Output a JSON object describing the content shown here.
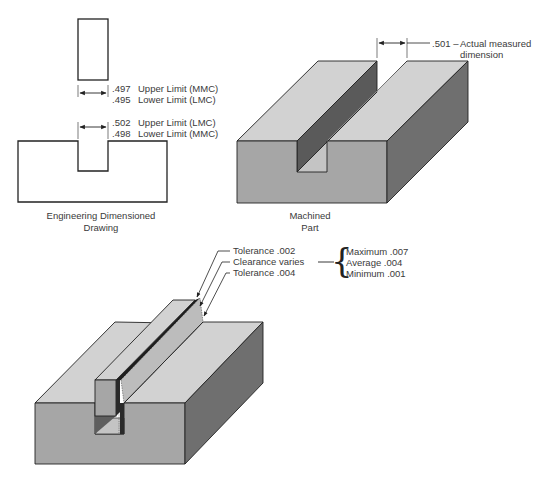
{
  "colors": {
    "top_face": "#d2d2d2",
    "front_face": "#a6a6a6",
    "side_face": "#6f6f6f",
    "slot_wall": "#5a5a5a",
    "slot_floor": "#c4c4c4",
    "clearance_dark": "#1e1e1e",
    "line": "#222222",
    "text": "#3a3a3a"
  },
  "drawing": {
    "shaft_dims": {
      "upper_value": ".497",
      "upper_label": "Upper Limit (MMC)",
      "lower_value": ".495",
      "lower_label": "Lower Limit (LMC)"
    },
    "slot_dims": {
      "upper_value": ".502",
      "upper_label": "Upper Limit (LMC)",
      "lower_value": ".498",
      "lower_label": "Lower Limit (MMC)"
    },
    "caption_line1": "Engineering Dimensioned",
    "caption_line2": "Drawing"
  },
  "machined_part": {
    "measured_value": ".501 –",
    "measured_label_line1": "Actual measured",
    "measured_label_line2": "dimension",
    "caption_line1": "Machined",
    "caption_line2": "Part"
  },
  "assembly": {
    "callouts": [
      {
        "label": "Tolerance .002"
      },
      {
        "label": "Clearance varies"
      },
      {
        "label": "Tolerance .004"
      }
    ],
    "clearance_range": {
      "maximum": "Maximum .007",
      "average": "Average .004",
      "minimum": "Minimum .001"
    },
    "brace_glyph": "{"
  }
}
